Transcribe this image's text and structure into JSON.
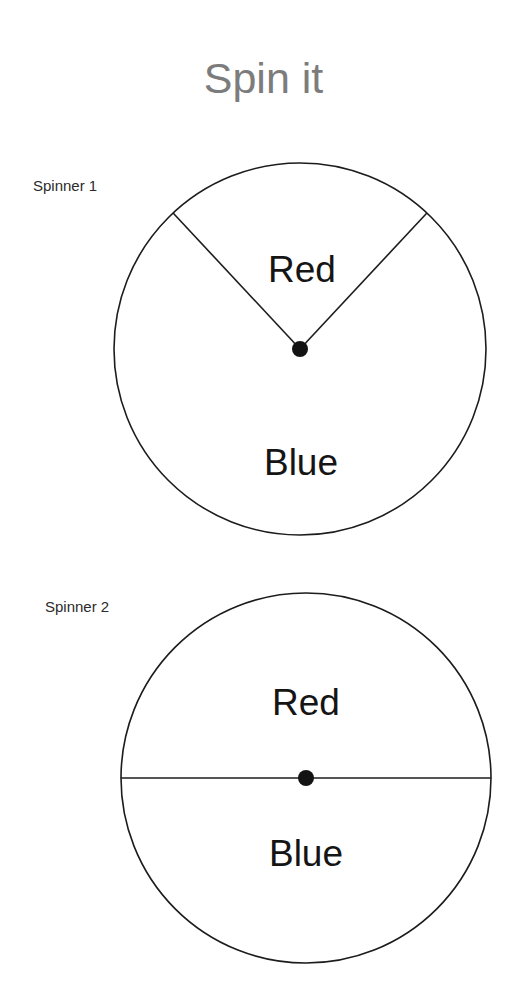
{
  "page": {
    "title": "Spin it",
    "background_color": "#ffffff",
    "title_color": "#7c7c7c",
    "ink_color": "#1c1c1c"
  },
  "spinners": [
    {
      "label": "Spinner 1",
      "center": {
        "x": 192,
        "y": 192
      },
      "radius": 186,
      "hub_radius": 8,
      "sectors": [
        {
          "name": "Red",
          "label": "Red",
          "start_angle_deg": 133,
          "end_angle_deg": 407,
          "sweep_deg": 274,
          "label_x": 194,
          "label_y": 115
        },
        {
          "name": "Blue",
          "label": "Blue",
          "start_angle_deg": 47,
          "end_angle_deg": 133,
          "sweep_deg": 86,
          "label_x": 193,
          "label_y": 308
        }
      ]
    },
    {
      "label": "Spinner 2",
      "center": {
        "x": 192,
        "y": 192
      },
      "radius": 185,
      "hub_radius": 8,
      "sectors": [
        {
          "name": "Red",
          "label": "Red",
          "start_angle_deg": 0,
          "end_angle_deg": 180,
          "sweep_deg": 180,
          "label_x": 192,
          "label_y": 119
        },
        {
          "name": "Blue",
          "label": "Blue",
          "start_angle_deg": 180,
          "end_angle_deg": 360,
          "sweep_deg": 180,
          "label_x": 192,
          "label_y": 270
        }
      ]
    }
  ]
}
